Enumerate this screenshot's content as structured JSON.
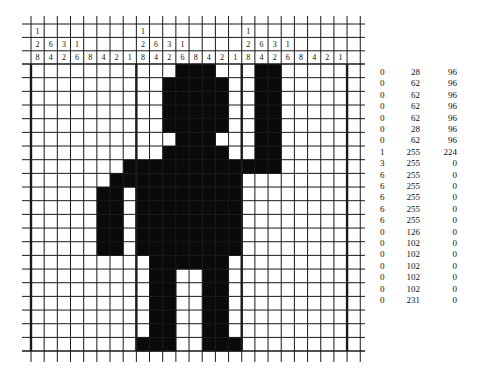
{
  "figure": {
    "type": "bitmap-grid",
    "bytes_per_row": 3,
    "bits_per_byte": 8,
    "header": {
      "row1": [
        "1",
        "",
        "",
        "",
        "",
        "",
        "",
        "",
        "1",
        "",
        "",
        "",
        "",
        "",
        "",
        "",
        "1",
        "",
        "",
        "",
        "",
        "",
        "",
        ""
      ],
      "row2": [
        "2",
        "6",
        "3",
        "1",
        "",
        "",
        "",
        "",
        "2",
        "6",
        "3",
        "1",
        "",
        "",
        "",
        "",
        "2",
        "6",
        "3",
        "1",
        "",
        "",
        "",
        ""
      ],
      "row3": [
        "8",
        "4",
        "2",
        "6",
        "8",
        "4",
        "2",
        "1",
        "8",
        "4",
        "2",
        "6",
        "8",
        "4",
        "2",
        "1",
        "8",
        "4",
        "2",
        "6",
        "8",
        "4",
        "2",
        "1"
      ]
    },
    "rows": [
      [
        0,
        28,
        96
      ],
      [
        0,
        62,
        96
      ],
      [
        0,
        62,
        96
      ],
      [
        0,
        62,
        96
      ],
      [
        0,
        62,
        96
      ],
      [
        0,
        28,
        96
      ],
      [
        0,
        62,
        96
      ],
      [
        1,
        255,
        224
      ],
      [
        3,
        255,
        0
      ],
      [
        6,
        255,
        0
      ],
      [
        6,
        255,
        0
      ],
      [
        6,
        255,
        0
      ],
      [
        6,
        255,
        0
      ],
      [
        6,
        255,
        0
      ],
      [
        0,
        126,
        0
      ],
      [
        0,
        102,
        0
      ],
      [
        0,
        102,
        0
      ],
      [
        0,
        102,
        0
      ],
      [
        0,
        102,
        0
      ],
      [
        0,
        102,
        0
      ],
      [
        0,
        231,
        0
      ]
    ],
    "colors": {
      "filled": "#0a0a0a",
      "empty": "#ffffff",
      "line": "#1a1a1a"
    }
  }
}
